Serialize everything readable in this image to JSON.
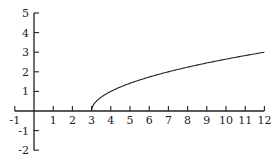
{
  "chart_data": {
    "type": "line",
    "title": "",
    "xlabel": "",
    "ylabel": "",
    "function": "y = sqrt(x - 3)",
    "xlim": [
      -1,
      12
    ],
    "ylim": [
      -2,
      5
    ],
    "grid": false,
    "legend": null,
    "x_ticks": [
      -1,
      1,
      2,
      3,
      4,
      5,
      6,
      7,
      8,
      9,
      10,
      11,
      12
    ],
    "y_ticks": [
      5,
      4,
      3,
      2,
      1,
      -1,
      -2
    ],
    "series": [
      {
        "name": "curve",
        "x": [
          3,
          3.25,
          4,
          5,
          6,
          7,
          8,
          9,
          10,
          11,
          12
        ],
        "y": [
          0,
          0.5,
          1.0,
          1.41,
          1.73,
          2.0,
          2.24,
          2.45,
          2.65,
          2.83,
          3.0
        ]
      }
    ]
  }
}
